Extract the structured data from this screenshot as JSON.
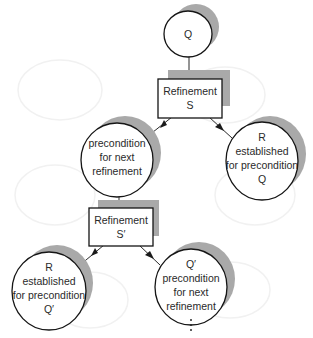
{
  "diagram": {
    "type": "refinement-tree",
    "nodes": {
      "q": {
        "shape": "ellipse",
        "lines": [
          "Q"
        ]
      },
      "refinement_s": {
        "shape": "box",
        "lines": [
          "Refinement",
          "S"
        ]
      },
      "precondition_next": {
        "shape": "ellipse",
        "lines": [
          "precondition",
          "for next",
          "refinement"
        ]
      },
      "r_established_q": {
        "shape": "ellipse",
        "lines": [
          "R",
          "established",
          "for precondition",
          "Q"
        ]
      },
      "refinement_s_prime": {
        "shape": "box",
        "lines": [
          "Refinement",
          "S′"
        ]
      },
      "r_established_q_prime": {
        "shape": "ellipse",
        "lines": [
          "R",
          "established",
          "for precondition",
          "Q′"
        ]
      },
      "q_prime_precondition_next": {
        "shape": "ellipse",
        "lines": [
          "Q′",
          "precondition",
          "for next",
          "refinement"
        ]
      }
    },
    "continuation": "⋮",
    "edges": [
      {
        "from": "q",
        "to": "refinement_s",
        "arrow": false
      },
      {
        "from": "refinement_s",
        "to": "precondition_next",
        "arrow": true
      },
      {
        "from": "refinement_s",
        "to": "r_established_q",
        "arrow": true
      },
      {
        "from": "precondition_next",
        "to": "refinement_s_prime",
        "arrow": false
      },
      {
        "from": "refinement_s_prime",
        "to": "r_established_q_prime",
        "arrow": true
      },
      {
        "from": "refinement_s_prime",
        "to": "q_prime_precondition_next",
        "arrow": true
      }
    ],
    "colors": {
      "outline": "#151515",
      "shadow": "#a9a9a9",
      "text": "#2a2a2a",
      "background": "#ffffff"
    }
  }
}
